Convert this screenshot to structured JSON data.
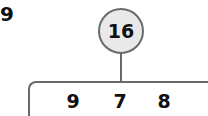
{
  "problem": {
    "number": "9"
  },
  "number_bond": {
    "whole": "16",
    "parts": [
      "9",
      "7",
      "8"
    ]
  },
  "colors": {
    "line": "#6a6a6a",
    "circle_fill": "#e9e9e9",
    "text": "#111111"
  }
}
